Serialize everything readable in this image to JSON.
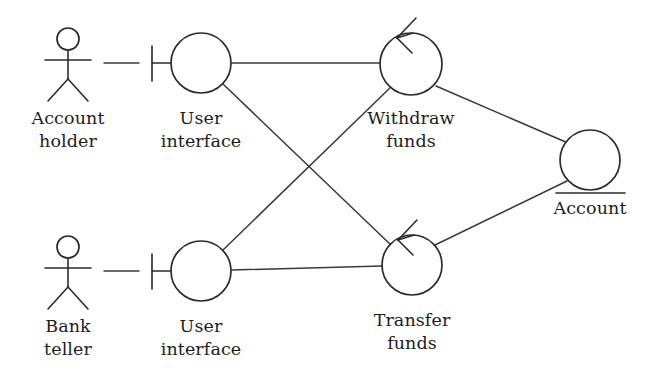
{
  "diagram": {
    "type": "uml-robustness-diagram",
    "background_color": "#ffffff",
    "line_color": "#2b2b2b",
    "text_color": "#1d1d1d",
    "nodes": [
      {
        "id": "account-holder",
        "kind": "actor",
        "label_line1": "Account",
        "label_line2": "holder",
        "x": 68,
        "y": 62
      },
      {
        "id": "user-interface-top",
        "kind": "boundary",
        "label_line1": "User",
        "label_line2": "interface",
        "x": 201,
        "y": 63,
        "radius": 30
      },
      {
        "id": "withdraw-funds",
        "kind": "control",
        "label_line1": "Withdraw",
        "label_line2": "funds",
        "x": 411,
        "y": 64,
        "radius": 31
      },
      {
        "id": "account-entity",
        "kind": "entity",
        "label_line1": "Account",
        "label_line2": "",
        "x": 590,
        "y": 160,
        "radius": 30
      },
      {
        "id": "bank-teller",
        "kind": "actor",
        "label_line1": "Bank",
        "label_line2": "teller",
        "x": 68,
        "y": 270
      },
      {
        "id": "user-interface-bottom",
        "kind": "boundary",
        "label_line1": "User",
        "label_line2": "interface",
        "x": 201,
        "y": 271,
        "radius": 30
      },
      {
        "id": "transfer-funds",
        "kind": "control",
        "label_line1": "Transfer",
        "label_line2": "funds",
        "x": 412,
        "y": 265,
        "radius": 30
      }
    ],
    "connections": [
      {
        "id": "conn-holder-ui",
        "from": "account-holder",
        "to": "user-interface-top"
      },
      {
        "id": "conn-ui-withdraw",
        "from": "user-interface-top",
        "to": "withdraw-funds"
      },
      {
        "id": "conn-ui-transfer",
        "from": "user-interface-top",
        "to": "transfer-funds"
      },
      {
        "id": "conn-teller-ui",
        "from": "bank-teller",
        "to": "user-interface-bottom"
      },
      {
        "id": "conn-ui2-transfer",
        "from": "user-interface-bottom",
        "to": "transfer-funds"
      },
      {
        "id": "conn-ui2-withdraw",
        "from": "user-interface-bottom",
        "to": "withdraw-funds"
      },
      {
        "id": "conn-withdraw-account",
        "from": "withdraw-funds",
        "to": "account-entity"
      },
      {
        "id": "conn-transfer-account",
        "from": "transfer-funds",
        "to": "account-entity"
      }
    ],
    "labels": {
      "account_holder_line1": "Account",
      "account_holder_line2": "holder",
      "user_interface_top_line1": "User",
      "user_interface_top_line2": "interface",
      "withdraw_funds_line1": "Withdraw",
      "withdraw_funds_line2": "funds",
      "account_entity": "Account",
      "bank_teller_line1": "Bank",
      "bank_teller_line2": "teller",
      "user_interface_bottom_line1": "User",
      "user_interface_bottom_line2": "interface",
      "transfer_funds_line1": "Transfer",
      "transfer_funds_line2": "funds"
    }
  }
}
